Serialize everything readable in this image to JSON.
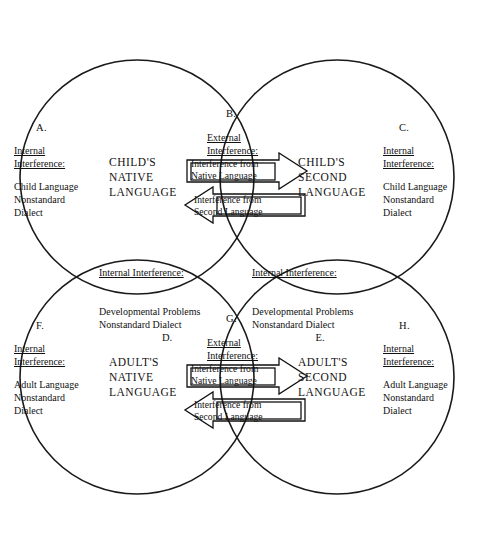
{
  "diagram": {
    "title_caps": {
      "child_native": "CHILD'S\nNATIVE\nLANGUAGE",
      "child_second": "CHILD'S\nSECOND\nLANGUAGE",
      "adult_native": "ADULT'S\nNATIVE\nLANGUAGE",
      "adult_second": "ADULT'S\nSECOND\nLANGUAGE"
    },
    "sections": {
      "A": {
        "letter": "A.",
        "heading": "Internal\nInterference:",
        "body": "Child Language\nNonstandard\nDialect"
      },
      "B": {
        "letter": "B.",
        "heading": "External\nInterference:",
        "arrow_right": "Interference from\nNative Language",
        "arrow_left": "Interference from\nSecond Language"
      },
      "C": {
        "letter": "C.",
        "heading": "Internal\nInterference:",
        "body": "Child Language\nNonstandard\nDialect"
      },
      "D": {
        "letter": "D.",
        "heading": "Internal Interference:",
        "body": "Developmental Problems\nNonstandard Dialect"
      },
      "E": {
        "letter": "E.",
        "heading": "Internal Interference:",
        "body": "Developmental Problems\nNonstandard Dialect"
      },
      "F": {
        "letter": "F.",
        "heading": "Internal\nInterference:",
        "body": "Adult Language\nNonstandard\nDialect"
      },
      "G": {
        "letter": "G.",
        "heading": "External\nInterference:",
        "arrow_right": "Interference from\nNative Language",
        "arrow_left": "Interference from\nSecond Language"
      },
      "H": {
        "letter": "H.",
        "heading": "Internal\nInterference:",
        "body": "Adult Language\nNonstandard\nDialect"
      }
    },
    "colors": {
      "stroke": "#1a1a1a",
      "text": "#111111",
      "background": "#ffffff"
    }
  }
}
